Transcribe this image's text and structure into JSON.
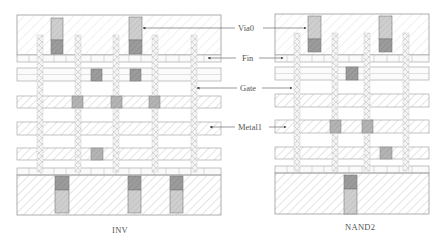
{
  "diagram": {
    "type": "standard-cell layout comparison",
    "cells": [
      {
        "name": "INV",
        "caption": "INV",
        "gate_count": 5,
        "via0_top": 2,
        "via0_bottom": 3,
        "metal1_contacts": 5
      },
      {
        "name": "NAND2",
        "caption": "NAND2",
        "gate_count": 4,
        "via0_top": 2,
        "via0_bottom": 1,
        "metal1_contacts": 4
      }
    ],
    "labels": {
      "via0": "Via0",
      "fin": "Fin",
      "gate": "Gate",
      "metal1": "Metal1"
    },
    "colors": {
      "outline": "#8a8a8a",
      "hatch": "#c8c8c8",
      "via_fill": "#a8a8a8",
      "via_dark": "#8c8c8c",
      "text": "#555555"
    }
  }
}
